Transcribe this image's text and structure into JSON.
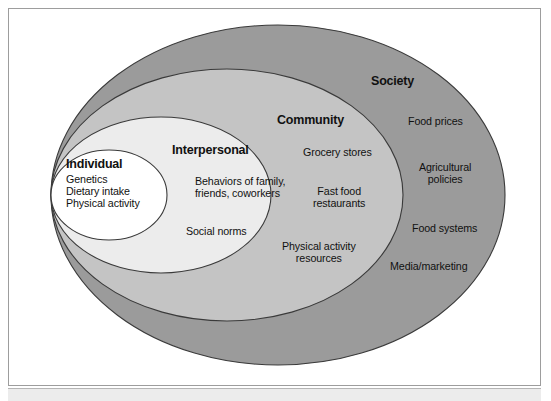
{
  "figure": {
    "type": "socio-ecological-model"
  },
  "colors": {
    "society_fill": "#9b9b9b",
    "community_fill": "#c4c4c4",
    "interpersonal_fill": "#ececec",
    "individual_fill": "#ffffff",
    "outline": "#3a3a3a",
    "text": "#111111",
    "frame_border": "#9d9d9d",
    "footer_strip": "#ececec"
  },
  "rings": [
    {
      "id": "society",
      "title": "Society",
      "fill": "#9b9b9b",
      "items": [
        "Food prices",
        "Agricultural\npolicies",
        "Food systems",
        "Media/marketing"
      ]
    },
    {
      "id": "community",
      "title": "Community",
      "fill": "#c4c4c4",
      "items": [
        "Grocery stores",
        "Fast food\nrestaurants",
        "Physical activity\nresources"
      ]
    },
    {
      "id": "interpersonal",
      "title": "Interpersonal",
      "fill": "#ececec",
      "items": [
        "Behaviors of family,\nfriends, coworkers",
        "Social norms"
      ]
    },
    {
      "id": "individual",
      "title": "Individual",
      "fill": "#ffffff",
      "items": [
        "Genetics\nDietary intake\nPhysical activity"
      ]
    }
  ]
}
